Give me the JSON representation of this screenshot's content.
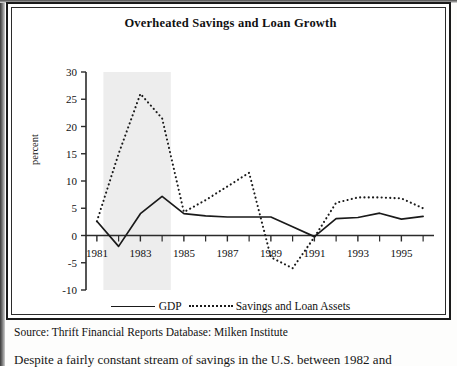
{
  "figure": {
    "title": "Overheated Savings and Loan Growth",
    "source": "Source: Thrift Financial Reports Database: Milken Institute",
    "body_text": "Despite a fairly constant stream of savings in the U.S. between 1982 and"
  },
  "legend": {
    "gdp_label": "GDP",
    "sl_label": "Savings and Loan Assets"
  },
  "colors": {
    "line": "#1a1a1a",
    "axis": "#2b2b2b",
    "shade": "#ededed",
    "frame": "#1a1a1a"
  },
  "chart_data": {
    "type": "line",
    "title": "Overheated Savings and Loan Growth",
    "xlabel": "",
    "ylabel": "percent",
    "xlim": [
      1980.5,
      1996.5
    ],
    "ylim": [
      -10,
      30
    ],
    "yticks": [
      -10,
      -5,
      0,
      5,
      10,
      15,
      20,
      25,
      30
    ],
    "ytick_labels": [
      "-10",
      "-5",
      "0",
      "5",
      "10",
      "15",
      "20",
      "25",
      "30"
    ],
    "xticks": [
      1981,
      1983,
      1985,
      1987,
      1989,
      1991,
      1993,
      1995
    ],
    "xtick_labels": [
      "1981",
      "1983",
      "1985",
      "1987",
      "1989",
      "1991",
      "1993",
      "1995"
    ],
    "xminor_ticks": [
      1982,
      1984,
      1986,
      1988,
      1990,
      1992,
      1994,
      1996
    ],
    "grid": false,
    "legend_position": "bottom",
    "shaded_region": {
      "x0": 1981.3,
      "x1": 1984.4,
      "color": "#ededed"
    },
    "x": [
      1981,
      1982,
      1983,
      1984,
      1985,
      1986,
      1987,
      1988,
      1989,
      1990,
      1991,
      1992,
      1993,
      1994,
      1995,
      1996
    ],
    "series": [
      {
        "name": "GDP",
        "style": "solid",
        "values": [
          2.6,
          -2.0,
          4.0,
          7.2,
          4.0,
          3.6,
          3.4,
          3.4,
          3.4,
          1.6,
          -0.2,
          3.1,
          3.3,
          4.1,
          3.0,
          3.5
        ]
      },
      {
        "name": "Savings and Loan Assets",
        "style": "dotted",
        "values": [
          2.6,
          15.0,
          26.0,
          21.5,
          4.3,
          6.5,
          9.0,
          11.5,
          -4.0,
          -6.0,
          -0.3,
          6.0,
          7.0,
          7.0,
          6.8,
          5.0
        ]
      }
    ]
  }
}
